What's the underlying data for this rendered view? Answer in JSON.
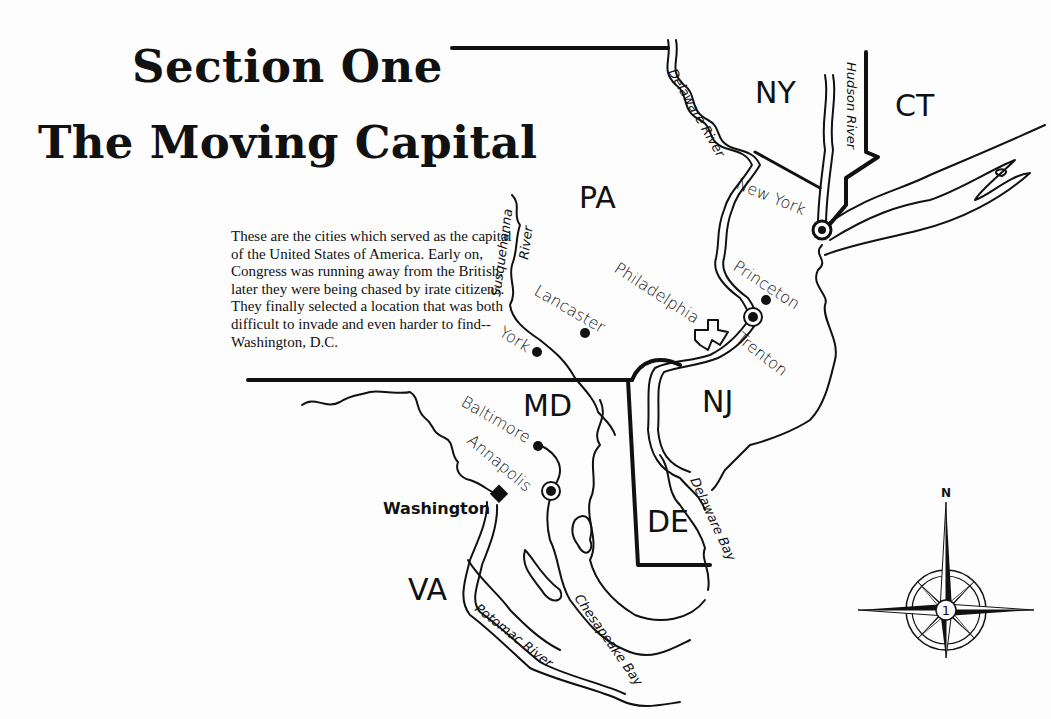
{
  "title": {
    "line1": "Section One",
    "line2": "The Moving Capital"
  },
  "intro_text": "These are the cities which served as the capital of the United States of America. Early on, Congress was running away from the British, later they were being chased by irate citizens.  They finally selected a location that was both difficult to invade and even harder to find--Washington, D.C.",
  "map": {
    "states": [
      "PA",
      "NY",
      "CT",
      "NJ",
      "MD",
      "DE",
      "VA"
    ],
    "cities": [
      {
        "name": "New York",
        "marker": "capital-circle"
      },
      {
        "name": "Princeton",
        "marker": "dot"
      },
      {
        "name": "Philadelphia",
        "marker": "outline-shape"
      },
      {
        "name": "Trenton",
        "marker": "capital-circle"
      },
      {
        "name": "Lancaster",
        "marker": "dot"
      },
      {
        "name": "York",
        "marker": "dot"
      },
      {
        "name": "Baltimore",
        "marker": "dot"
      },
      {
        "name": "Annapolis",
        "marker": "capital-circle"
      },
      {
        "name": "Washington",
        "marker": "diamond"
      }
    ],
    "waters": [
      "Delaware River",
      "Hudson River",
      "Susquehanna River",
      "Delaware Bay",
      "Chesapeake Bay",
      "Potomac River"
    ],
    "compass": {
      "north_label": "N",
      "center_label": "1"
    }
  }
}
